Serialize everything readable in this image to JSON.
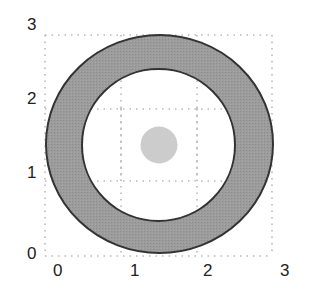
{
  "figure": {
    "colors": {
      "ring_fill": "#9a9a9a",
      "ring_stroke": "#333333",
      "inner_fill": "#ffffff",
      "dot_fill": "#cccccc",
      "grid": "#b8b8b8",
      "label": "#222222"
    },
    "x_axis": {
      "ticks": [
        "0",
        "1",
        "2",
        "3"
      ]
    },
    "y_axis": {
      "ticks": [
        "0",
        "1",
        "2",
        "3"
      ]
    },
    "grid": {
      "style": "dotted",
      "range": [
        0,
        3
      ]
    },
    "ring": {
      "center": [
        1.5,
        1.5
      ],
      "outer_radius": 1.5,
      "inner_radius": 1.05
    },
    "dot": {
      "center": [
        1.5,
        1.5
      ],
      "radius": 0.25
    }
  }
}
